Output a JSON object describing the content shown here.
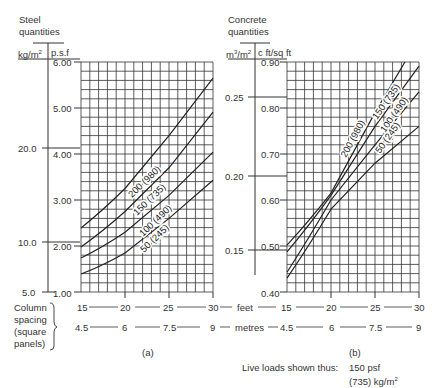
{
  "chart_data": [
    {
      "id": "a",
      "type": "line",
      "caption": "(a)",
      "title": "Steel quantities",
      "ylabel_left": "kg/m²",
      "ylabel_right": "p.s.f",
      "xlabel": "Column spacing (square panels)",
      "x_units": [
        "feet",
        "metres"
      ],
      "xlim": [
        15,
        30
      ],
      "ylim": [
        1.0,
        6.0
      ],
      "x_ticks_feet": [
        "15",
        "20",
        "25",
        "30"
      ],
      "x_ticks_metres": [
        "4.5",
        "6",
        "7.5",
        "9"
      ],
      "y_ticks_psf": [
        "6.00",
        "5.00",
        "4.00",
        "3.00",
        "2.00",
        "1.00"
      ],
      "y_ticks_kgm2": [
        "20.0",
        "10.0",
        "5.0"
      ],
      "grid": true,
      "x": [
        15,
        20,
        25,
        30
      ],
      "series": [
        {
          "name": "200 (980)",
          "values": [
            2.39,
            3.25,
            4.4,
            5.65
          ]
        },
        {
          "name": "150 (735)",
          "values": [
            1.98,
            2.75,
            3.7,
            4.91
          ]
        },
        {
          "name": "100 (490)",
          "values": [
            1.74,
            2.3,
            3.1,
            4.04
          ]
        },
        {
          "name": "50 (245)",
          "values": [
            1.39,
            1.85,
            2.6,
            3.43
          ]
        }
      ]
    },
    {
      "id": "b",
      "type": "line",
      "caption": "(b)",
      "title": "Concrete quantities",
      "ylabel_left": "m³/m²",
      "ylabel_right": "c ft/sq ft",
      "xlabel": "Column spacing (square panels)",
      "x_units": [
        "feet",
        "metres"
      ],
      "xlim": [
        15,
        30
      ],
      "ylim": [
        0.4,
        0.9
      ],
      "x_ticks_feet": [
        "15",
        "20",
        "25",
        "30"
      ],
      "x_ticks_metres": [
        "4.5",
        "6",
        "7.5",
        "9"
      ],
      "y_ticks_cft": [
        "0.90",
        "0.80",
        "0.70",
        "0.60",
        "0.50",
        "0.40"
      ],
      "y_ticks_m3m2": [
        "0.25",
        "0.20",
        "0.15"
      ],
      "grid": true,
      "x": [
        15,
        20,
        25,
        28.4,
        30
      ],
      "series": [
        {
          "name": "200 (980)",
          "values": [
            0.502,
            0.615,
            0.79,
            0.9,
            null
          ]
        },
        {
          "name": "150 (735)",
          "values": [
            0.487,
            0.61,
            0.76,
            null,
            0.891
          ]
        },
        {
          "name": "100 (490)",
          "values": [
            0.443,
            0.6,
            0.72,
            null,
            0.835
          ]
        },
        {
          "name": "50 (245)",
          "values": [
            0.43,
            0.58,
            0.68,
            null,
            0.76
          ]
        }
      ]
    }
  ],
  "labels": {
    "steel_title_1": "Steel",
    "steel_title_2": "quantities",
    "steel_unit_left": "kg/m",
    "steel_unit_left_sup": "2",
    "steel_unit_right": "p.s.f",
    "concrete_title_1": "Concrete",
    "concrete_title_2": "quantities",
    "concrete_unit_left": "m",
    "concrete_unit_left_sup1": "3",
    "concrete_unit_left_mid": "/m",
    "concrete_unit_left_sup2": "2",
    "concrete_unit_right": "c ft/sq ft",
    "column_spacing_1": "Column",
    "column_spacing_2": "spacing",
    "column_spacing_3": "(square",
    "column_spacing_4": "panels)",
    "feet": "feet",
    "metres": "metres",
    "caption_a": "(a)",
    "caption_b": "(b)",
    "legend_label": "Live loads shown thus:",
    "legend_value_1": "150 psf",
    "legend_value_2": "(735) kg/m",
    "legend_value_sup": "2"
  },
  "axes": {
    "a_psf": [
      "6.00",
      "5.00",
      "4.00",
      "3.00",
      "2.00",
      "1.00"
    ],
    "a_kg": [
      "20.0",
      "10.0",
      "5.0"
    ],
    "b_cft": [
      "0.90",
      "0.80",
      "0.70",
      "0.60",
      "0.50",
      "0.40"
    ],
    "b_m3": [
      "0.25",
      "0.20",
      "0.15"
    ],
    "feet": [
      "15",
      "20",
      "25",
      "30"
    ],
    "metres": [
      "4.5",
      "6",
      "7.5",
      "9"
    ]
  },
  "curve_labels": [
    "200 (980)",
    "150 (735)",
    "100 (490)",
    "50 (245)"
  ]
}
